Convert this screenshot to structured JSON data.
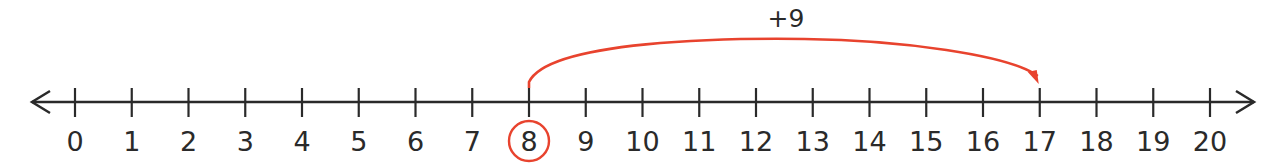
{
  "number_line": {
    "min": 0,
    "max": 20,
    "labels": [
      "0",
      "1",
      "2",
      "3",
      "4",
      "5",
      "6",
      "7",
      "8",
      "9",
      "10",
      "11",
      "12",
      "13",
      "14",
      "15",
      "16",
      "17",
      "18",
      "19",
      "20"
    ],
    "arrows": "both",
    "line_color": "#2a2a2a"
  },
  "jump": {
    "label": "+9",
    "from": 8,
    "to": 17,
    "color": "#e8432e"
  },
  "highlight": {
    "value": 8,
    "shape": "circle",
    "color": "#e8432e"
  }
}
